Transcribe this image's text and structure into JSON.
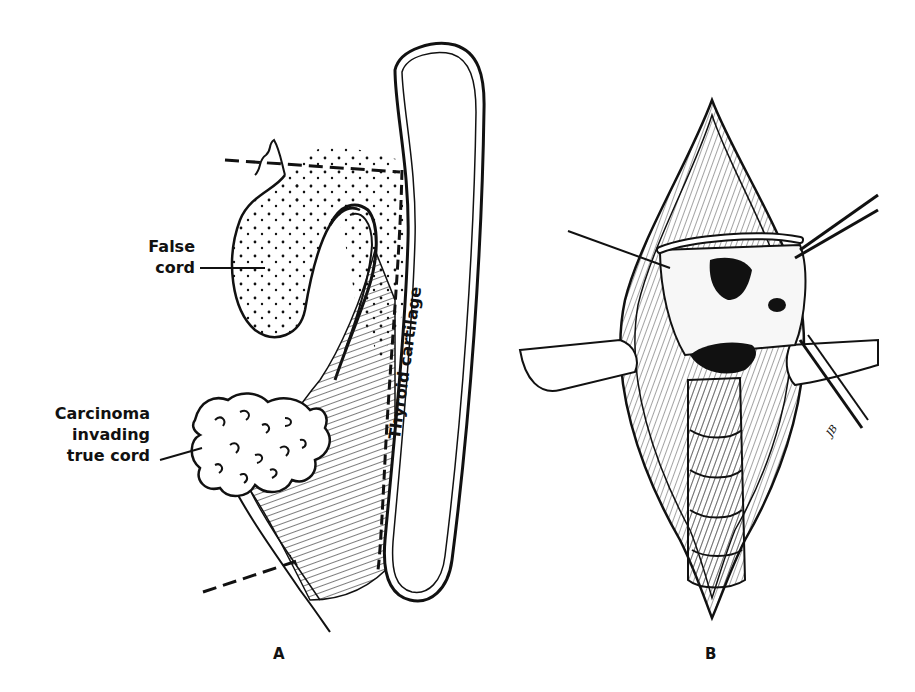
{
  "figure": {
    "panel_a": {
      "letter": "A",
      "labels": {
        "false_cord_line1": "False",
        "false_cord_line2": "cord",
        "carcinoma_line1": "Carcinoma",
        "carcinoma_line2": "invading",
        "carcinoma_line3": "true cord",
        "thyroid_cartilage": "Thyroid cartilage"
      }
    },
    "panel_b": {
      "letter": "B",
      "artist_signature": "JB"
    }
  }
}
